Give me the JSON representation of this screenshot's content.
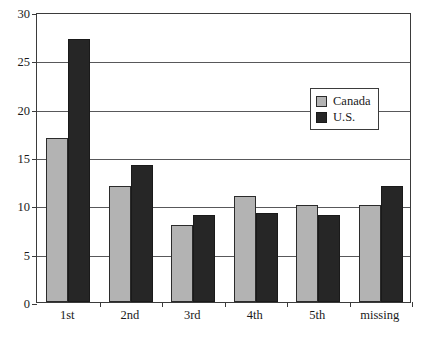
{
  "chart_data": {
    "type": "bar",
    "title": "",
    "subtitle": "",
    "xlabel": "",
    "ylabel": "",
    "categories": [
      "1st",
      "2nd",
      "3rd",
      "4th",
      "5th",
      "missing"
    ],
    "series": [
      {
        "name": "Canada",
        "color": "#b3b3b3",
        "values": [
          17,
          12,
          8,
          11,
          10,
          10
        ]
      },
      {
        "name": "U.S.",
        "color": "#262626",
        "values": [
          27.2,
          14.2,
          9,
          9.2,
          9,
          12
        ]
      }
    ],
    "ylim": [
      0,
      30
    ],
    "ytick_values": [
      0,
      5,
      10,
      15,
      20,
      25,
      30
    ],
    "ytick_labels": [
      "0",
      "5",
      "10",
      "15",
      "20",
      "25",
      "30"
    ],
    "grid": "horizontal",
    "legend_position": "top-right-inside",
    "legend_entries": [
      "Canada",
      "U.S."
    ]
  },
  "legend": {
    "items": [
      {
        "label": "Canada",
        "swatch": "gray-square-swatch"
      },
      {
        "label": "U.S.",
        "swatch": "black-square-swatch"
      }
    ]
  },
  "colors": {
    "canada": "#b3b3b3",
    "us": "#262626",
    "axis": "#3b3b3b",
    "gridline": "#58585a",
    "background": "#ffffff"
  }
}
